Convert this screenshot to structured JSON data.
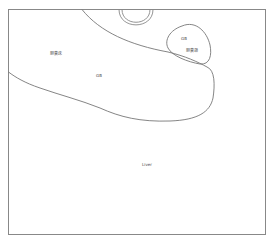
{
  "diagram": {
    "frame_label": "Liver",
    "regions": [
      {
        "id": "gallbladder-bed",
        "labels": [
          "胆囊床",
          "GB"
        ]
      },
      {
        "id": "gallbladder",
        "labels": [
          "GB",
          "胆囊颈"
        ]
      },
      {
        "id": "top-semicircle",
        "labels": []
      }
    ],
    "labels": {
      "liver": "Liver",
      "bed_cn": "胆囊床",
      "bed_gb": "GB",
      "gb": "GB",
      "neck_cn": "胆囊颈"
    },
    "colors": {
      "stroke": "#777777",
      "text": "#444444",
      "background": "#ffffff"
    }
  }
}
